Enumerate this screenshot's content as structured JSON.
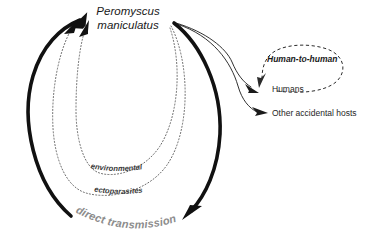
{
  "diagram": {
    "nodes": {
      "reservoir_line1": "Peromyscus",
      "reservoir_line2": "maniculatus",
      "humans": "Humans",
      "other_hosts": "Other accidental hosts",
      "human_to_human": "Human-to-human"
    },
    "edge_labels": {
      "environmental": "environmental",
      "ectoparasites": "ectoparasites",
      "direct_transmission": "direct transmission"
    },
    "colors": {
      "thick_arrow": "#111111",
      "thin_arrow": "#1a1a1a",
      "dotted_arc": "#5a5a5a",
      "dashed_loop": "#2b2b2b",
      "arc_label": "#8c8c8c",
      "text": "#1a1a1a",
      "background": "#ffffff"
    }
  }
}
